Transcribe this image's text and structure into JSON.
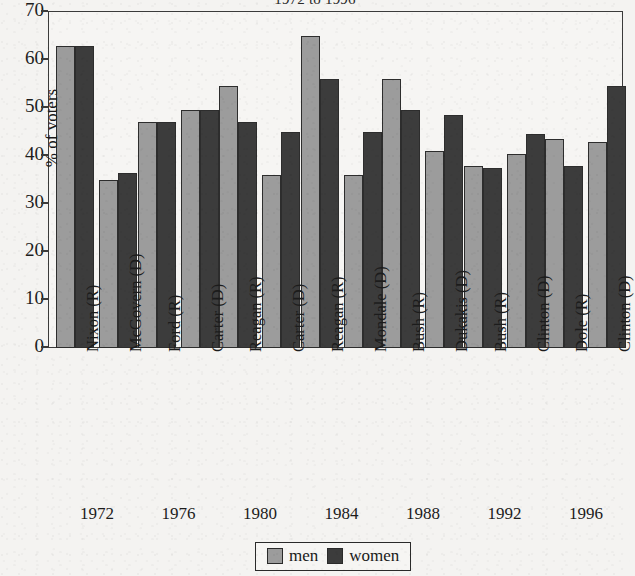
{
  "chart_data": {
    "type": "bar",
    "title": "1972 to 1996",
    "xlabel": "",
    "ylabel": "% of voters",
    "ylim": [
      0,
      70
    ],
    "ytick_step": 10,
    "yticks": [
      0,
      10,
      20,
      30,
      40,
      50,
      60,
      70
    ],
    "grid": false,
    "legend_position": "bottom-center",
    "legend": [
      "men",
      "women"
    ],
    "categories": [
      "Nixon (R)",
      "McGovern (D)",
      "Ford (R)",
      "Carter (D)",
      "Reagan (R)",
      "Carter (D)",
      "Reagan (R)",
      "Mondale (D)",
      "Bush (R)",
      "Dukakis (D)",
      "Bush (R)",
      "Clinton (D)",
      "Dole (R)",
      "Clinton (D)"
    ],
    "group_labels": [
      "1972",
      "1976",
      "1980",
      "1984",
      "1988",
      "1992",
      "1996"
    ],
    "series": [
      {
        "name": "men",
        "color": "#9c9c9c",
        "values": [
          63.0,
          35.0,
          47.0,
          49.5,
          54.5,
          36.0,
          65.0,
          36.0,
          56.0,
          41.0,
          38.0,
          40.5,
          43.5,
          43.0
        ]
      },
      {
        "name": "women",
        "color": "#3c3c3c",
        "values": [
          63.0,
          36.5,
          47.0,
          49.5,
          47.0,
          45.0,
          56.0,
          45.0,
          49.5,
          48.5,
          37.5,
          44.5,
          38.0,
          54.5
        ]
      }
    ]
  },
  "axes": {
    "y_label": "% of voters",
    "y_ticks": [
      "70",
      "60",
      "50",
      "40",
      "30",
      "20",
      "10",
      "0"
    ]
  },
  "legend": {
    "men_label": "men",
    "women_label": "women"
  },
  "title": "1972 to 1996",
  "colors": {
    "men": "#9c9c9c",
    "women": "#3c3c3c",
    "axis": "#3b3b3b",
    "paper": "#f4f3f1"
  }
}
